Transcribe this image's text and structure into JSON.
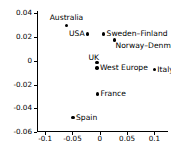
{
  "chart_data": {
    "type": "scatter",
    "title": "",
    "xlabel": "",
    "ylabel": "",
    "xlim": [
      -0.115,
      0.125
    ],
    "ylim": [
      -0.06,
      0.042
    ],
    "grid": false,
    "legend": null,
    "xticks": [
      "-0.1",
      "-0.05",
      "0",
      "0.05",
      "0.1"
    ],
    "xtick_values": [
      -0.1,
      -0.05,
      0,
      0.05,
      0.1
    ],
    "yticks": [
      "0.04",
      "0.02",
      "0",
      "-0.02",
      "-0.04",
      "-0.06"
    ],
    "ytick_values": [
      0.04,
      0.02,
      0,
      -0.02,
      -0.04,
      -0.06
    ],
    "points": [
      {
        "label": "Australia",
        "x": -0.061,
        "y": 0.03,
        "label_pos": "above"
      },
      {
        "label": "USA",
        "x": -0.022,
        "y": 0.0225,
        "label_pos": "left"
      },
      {
        "label": "Sweden–Finland",
        "x": 0.007,
        "y": 0.0225,
        "label_pos": "right"
      },
      {
        "label": "Norway–Denmark",
        "x": 0.027,
        "y": 0.0175,
        "label_pos": "below-right"
      },
      {
        "label": "UK",
        "x": -0.005,
        "y": -0.0015,
        "label_pos": "above-left"
      },
      {
        "label": "West Europe",
        "x": -0.005,
        "y": -0.006,
        "label_pos": "right"
      },
      {
        "label": "Italy",
        "x": 0.1,
        "y": -0.0075,
        "label_pos": "right"
      },
      {
        "label": "France",
        "x": -0.004,
        "y": -0.028,
        "label_pos": "right"
      },
      {
        "label": "Spain",
        "x": -0.049,
        "y": -0.048,
        "label_pos": "right"
      }
    ],
    "marker_color": "#000000",
    "axis_color": "#000000",
    "background_color": "#ffffff"
  }
}
